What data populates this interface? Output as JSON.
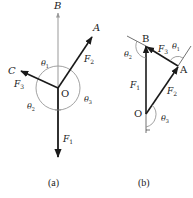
{
  "figure_a": {
    "caption": "(a)",
    "points": {
      "origin": "O",
      "a": "A",
      "b": "B",
      "c": "C"
    },
    "forces": {
      "f1": "F",
      "f1_sub": "1",
      "f2": "F",
      "f2_sub": "2",
      "f3": "F",
      "f3_sub": "3"
    },
    "angles": {
      "t1": "θ",
      "t1_sub": "1",
      "t2": "θ",
      "t2_sub": "2",
      "t3": "θ",
      "t3_sub": "3"
    }
  },
  "figure_b": {
    "caption": "(b)",
    "points": {
      "origin": "O",
      "a": "A",
      "b": "B"
    },
    "forces": {
      "f1": "F",
      "f1_sub": "1",
      "f2": "F",
      "f2_sub": "2",
      "f3": "F",
      "f3_sub": "3"
    },
    "angles": {
      "t1": "θ",
      "t1_sub": "1",
      "t2": "θ",
      "t2_sub": "2",
      "t3": "θ",
      "t3_sub": "3"
    }
  },
  "colors": {
    "vector": "#1a1a1a",
    "axis": "#999999",
    "arc": "#8a8a8a"
  }
}
